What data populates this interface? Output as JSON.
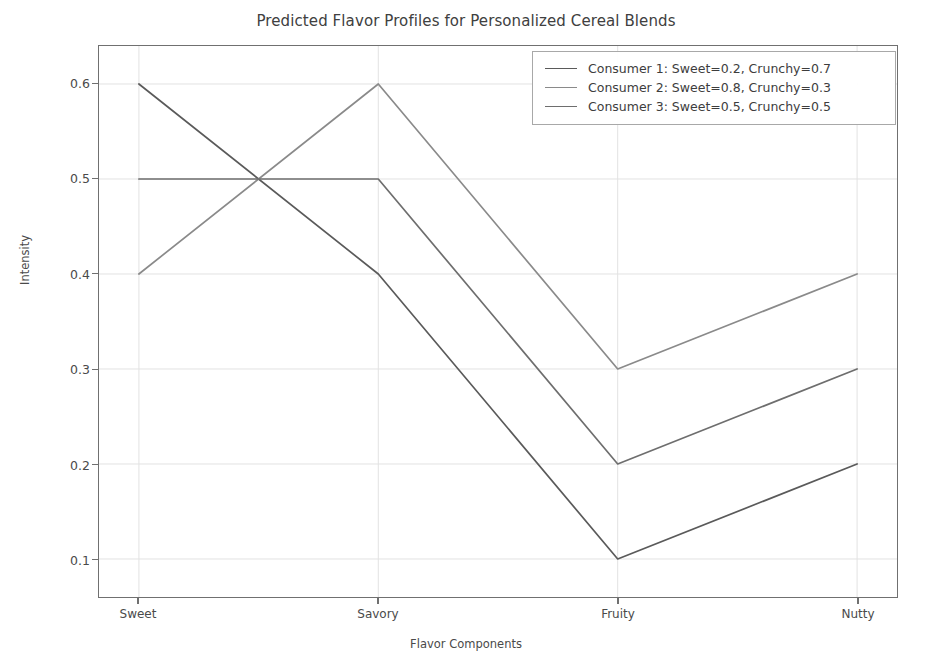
{
  "chart_data": {
    "type": "line",
    "title": "Predicted Flavor Profiles for Personalized Cereal Blends",
    "xlabel": "Flavor Components",
    "ylabel": "Intensity",
    "categories": [
      "Sweet",
      "Savory",
      "Fruity",
      "Nutty"
    ],
    "ytick_labels": [
      "0.1",
      "0.2",
      "0.3",
      "0.4",
      "0.5",
      "0.6"
    ],
    "ytick_values": [
      0.1,
      0.2,
      0.3,
      0.4,
      0.5,
      0.6
    ],
    "ylim": [
      0.06,
      0.64
    ],
    "grid": true,
    "legend_position": "upper right",
    "series": [
      {
        "name": "Consumer 1: Sweet=0.2, Crunchy=0.7",
        "values": [
          0.6,
          0.4,
          0.1,
          0.2
        ],
        "color": "#5a5a5a"
      },
      {
        "name": "Consumer 2: Sweet=0.8, Crunchy=0.3",
        "values": [
          0.4,
          0.6,
          0.3,
          0.4
        ],
        "color": "#8a8a8a"
      },
      {
        "name": "Consumer 3: Sweet=0.5, Crunchy=0.5",
        "values": [
          0.5,
          0.5,
          0.2,
          0.3
        ],
        "color": "#6e6e6e"
      }
    ],
    "colors": {
      "background": "#ffffff",
      "axis": "#707070",
      "grid": "#e2e2e2",
      "text": "#4a4a4a"
    }
  }
}
